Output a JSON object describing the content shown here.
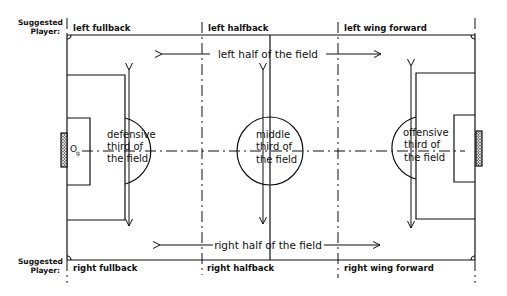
{
  "diagram": {
    "suggested_label_top": [
      "Suggested",
      "Player:"
    ],
    "suggested_label_bottom": [
      "Suggested",
      "Player:"
    ],
    "top_positions": [
      "left fullback",
      "left halfback",
      "left wing forward"
    ],
    "bottom_positions": [
      "right fullback",
      "right halfback",
      "right wing forward"
    ],
    "zones": {
      "defensive": [
        "defensive",
        "third of",
        "the field"
      ],
      "middle": [
        "middle",
        "third of",
        "the field"
      ],
      "offensive": [
        "offensive",
        "third of",
        "the field"
      ]
    },
    "halves": {
      "left": "left half of the field",
      "right": "right half of the field"
    },
    "goal_marker": {
      "letter": "O",
      "subscript": "g"
    },
    "colors": {
      "line": "#111111",
      "background": "#ffffff"
    }
  }
}
